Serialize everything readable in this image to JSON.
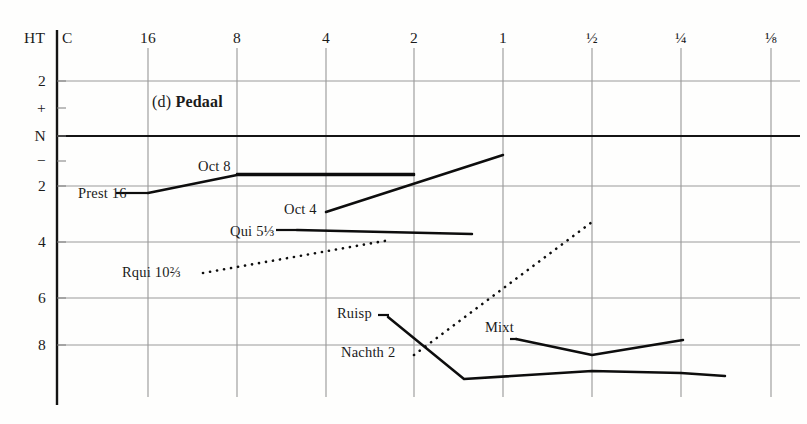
{
  "figure": {
    "panel_label": "(d)",
    "panel_title": "Pedaal",
    "corner_left_label": "HT",
    "corner_right_label": "C"
  },
  "chart_data": {
    "type": "line",
    "title": "(d) Pedaal",
    "xlabel": "",
    "ylabel": "",
    "grid": true,
    "legend": "inline-labels",
    "x_axis": {
      "position": "top",
      "tick_labels": [
        "16",
        "8",
        "4",
        "2",
        "1",
        "½",
        "¼",
        "⅛"
      ],
      "tick_px": [
        148,
        237,
        326,
        414,
        503,
        592,
        681,
        771
      ]
    },
    "y_axis": {
      "position": "left",
      "tick_labels": [
        "2",
        "+",
        "N",
        "−",
        "2",
        "4",
        "6",
        "8"
      ],
      "tick_px": [
        81,
        108,
        136,
        161,
        186,
        242,
        298,
        345
      ],
      "gridline_labels": [
        "2",
        "N",
        "2",
        "4",
        "6",
        "8"
      ],
      "zero_label": "N"
    },
    "series": [
      {
        "name": "Prest 16",
        "label": "Prest 16",
        "style": "solid",
        "label_px": {
          "x": 78,
          "y": 193
        },
        "points_px": [
          [
            148,
            193
          ],
          [
            237,
            175
          ],
          [
            414,
            175
          ]
        ],
        "points": [
          [
            16,
            -2.0
          ],
          [
            8,
            -1.3
          ],
          [
            2,
            -1.3
          ]
        ]
      },
      {
        "name": "Oct 8",
        "label": "Oct 8",
        "style": "solid",
        "label_px": {
          "x": 198,
          "y": 166
        },
        "points_px": [
          [
            237,
            174
          ],
          [
            414,
            174
          ]
        ],
        "points": [
          [
            8,
            -1.3
          ],
          [
            2,
            -1.3
          ]
        ]
      },
      {
        "name": "Oct 4",
        "label": "Oct 4",
        "style": "solid",
        "label_px": {
          "x": 284,
          "y": 209
        },
        "points_px": [
          [
            326,
            212
          ],
          [
            503,
            155
          ]
        ],
        "points": [
          [
            4,
            -2.9
          ],
          [
            1,
            -0.7
          ]
        ]
      },
      {
        "name": "Qui 5⅓",
        "label": "Qui 5⅓",
        "style": "solid",
        "label_px": {
          "x": 230,
          "y": 231
        },
        "points_px": [
          [
            297,
            230
          ],
          [
            472,
            234
          ]
        ],
        "points": [
          [
            5.33,
            -3.6
          ],
          [
            1.3,
            -3.8
          ]
        ]
      },
      {
        "name": "Rqui 10⅔",
        "label": "Rqui 10⅔",
        "style": "dotted",
        "label_px": {
          "x": 122,
          "y": 272
        },
        "points_px": [
          [
            203,
            273
          ],
          [
            390,
            240
          ]
        ],
        "points": [
          [
            10.67,
            -5.3
          ],
          [
            2.4,
            -4.0
          ]
        ]
      },
      {
        "name": "Ruisp",
        "label": "Ruisp",
        "style": "solid",
        "label_px": {
          "x": 337,
          "y": 313
        },
        "points_px": [
          [
            388,
            317
          ],
          [
            464,
            379
          ],
          [
            592,
            371
          ],
          [
            681,
            373
          ],
          [
            725,
            376
          ]
        ],
        "points": [
          [
            2.6,
            -7.0
          ],
          [
            1.4,
            -9.4
          ],
          [
            0.5,
            -9.1
          ],
          [
            0.25,
            -9.2
          ],
          [
            0.19,
            -9.3
          ]
        ]
      },
      {
        "name": "Nachth 2",
        "label": "Nachth 2",
        "style": "dotted",
        "label_px": {
          "x": 341,
          "y": 352
        },
        "points_px": [
          [
            414,
            355
          ],
          [
            592,
            222
          ]
        ],
        "points": [
          [
            2,
            -8.3
          ],
          [
            0.5,
            -3.4
          ]
        ]
      },
      {
        "name": "Mixt",
        "label": "Mixt",
        "style": "solid",
        "label_px": {
          "x": 485,
          "y": 327
        },
        "points_px": [
          [
            516,
            339
          ],
          [
            592,
            355
          ],
          [
            683,
            340
          ]
        ],
        "points": [
          [
            0.92,
            -8.0
          ],
          [
            0.5,
            -8.6
          ],
          [
            0.24,
            -8.0
          ]
        ]
      }
    ]
  }
}
